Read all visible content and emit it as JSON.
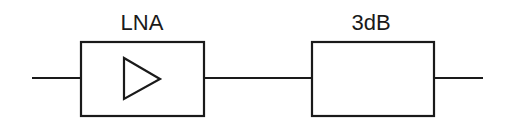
{
  "diagram": {
    "title": "",
    "blocks": [
      {
        "id": "lna",
        "label": "LNA",
        "symbol": "amplifier-triangle",
        "type": "low-noise-amplifier"
      },
      {
        "id": "attenuator",
        "label": "3dB",
        "symbol": "none",
        "type": "attenuator"
      }
    ],
    "connections": [
      {
        "from": "input",
        "to": "lna"
      },
      {
        "from": "lna",
        "to": "attenuator"
      },
      {
        "from": "attenuator",
        "to": "output"
      }
    ],
    "colors": {
      "stroke": "#1a1a1a",
      "background": "#ffffff"
    }
  }
}
